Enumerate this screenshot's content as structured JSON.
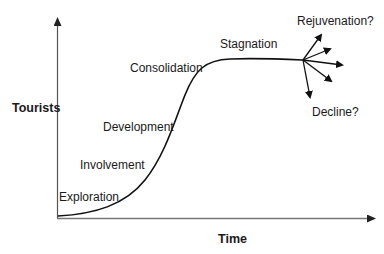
{
  "diagram": {
    "type": "tourism-area-life-cycle",
    "axes": {
      "y_label": "Tourists",
      "x_label": "Time"
    },
    "stages": [
      {
        "label": "Exploration"
      },
      {
        "label": "Involvement"
      },
      {
        "label": "Development"
      },
      {
        "label": "Consolidation"
      },
      {
        "label": "Stagnation"
      }
    ],
    "outcomes": {
      "upper": "Rejuvenation?",
      "lower": "Decline?"
    },
    "colors": {
      "line": "#111111",
      "axis": "#555555",
      "text": "#1a1a1a",
      "background": "#ffffff"
    }
  }
}
